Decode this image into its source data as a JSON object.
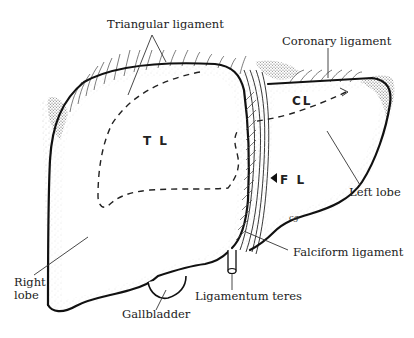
{
  "diagram": {
    "type": "anatomical-illustration",
    "labels": {
      "triangular_ligament": "Triangular ligament",
      "coronary_ligament": "Coronary ligament",
      "left_lobe": "Left lobe",
      "right_lobe_line1": "Right",
      "right_lobe_line2": "lobe",
      "gallbladder": "Gallbladder",
      "ligamentum_teres": "Ligamentum teres",
      "falciform_ligament": "Falciform ligament"
    },
    "region_abbreviations": {
      "tl": "T L",
      "cl": "CL",
      "fl": "F L"
    },
    "signature": "cg",
    "colors": {
      "ink": "#111111",
      "background": "#ffffff",
      "stipple": "#555555"
    }
  }
}
